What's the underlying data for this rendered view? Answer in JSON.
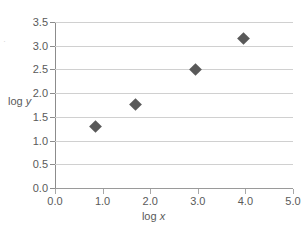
{
  "chart_data": {
    "type": "scatter",
    "title": "",
    "xlabel": "log x",
    "ylabel": "log y",
    "xlim": [
      0.0,
      5.0
    ],
    "ylim": [
      0.0,
      3.5
    ],
    "x_ticks": [
      "0.0",
      "1.0",
      "2.0",
      "3.0",
      "4.0",
      "5.0"
    ],
    "x_tick_values": [
      0.0,
      1.0,
      2.0,
      3.0,
      4.0,
      5.0
    ],
    "y_ticks": [
      "0.0",
      "0.5",
      "1.0",
      "1.5",
      "2.0",
      "2.5",
      "3.0",
      "3.5"
    ],
    "y_tick_values": [
      0.0,
      0.5,
      1.0,
      1.5,
      2.0,
      2.5,
      3.0,
      3.5
    ],
    "grid": "horizontal",
    "legend": "none",
    "marker_shape": "diamond",
    "marker_color": "#595959",
    "gridline_color": "#d0d0d0",
    "axis_color": "#8c8c8c",
    "series": [
      {
        "name": "",
        "points": [
          {
            "x": 0.86,
            "y": 1.3
          },
          {
            "x": 1.7,
            "y": 1.76
          },
          {
            "x": 2.95,
            "y": 2.5
          },
          {
            "x": 3.97,
            "y": 3.16
          }
        ]
      }
    ]
  },
  "artifact": {
    "mark": "·"
  }
}
